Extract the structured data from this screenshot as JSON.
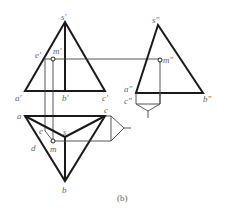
{
  "figure": {
    "caption": "(b)",
    "front_view": {
      "labels": {
        "s": "s′",
        "e": "e′",
        "m": "m′",
        "a": "a′",
        "b": "b′",
        "c": "c′"
      }
    },
    "side_view": {
      "labels": {
        "s": "s″",
        "m": "m″",
        "a": "a″",
        "c": "c″",
        "b": "b″"
      }
    },
    "top_view": {
      "labels": {
        "a": "a",
        "c": "c",
        "e": "e",
        "s": "s",
        "d": "d",
        "m": "m",
        "b": "b"
      }
    },
    "colors": {
      "outline": "#1a1a1a",
      "projection_line": "#444444",
      "label": "#666666"
    }
  }
}
